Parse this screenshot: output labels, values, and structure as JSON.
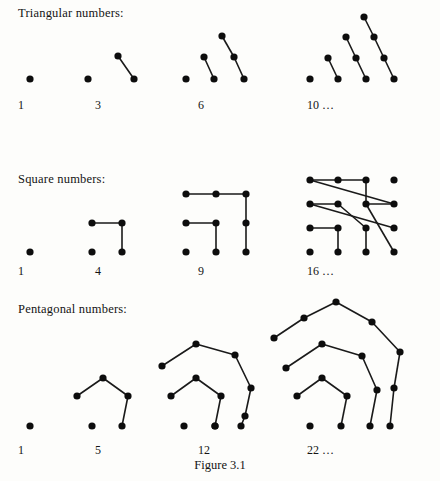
{
  "caption": "Figure 3.1",
  "dot_color": "#0d0d0d",
  "line_color": "#1a1a1a",
  "background": "#fdfdfb",
  "dot_radius": 3.6,
  "sections": [
    {
      "id": "triangular",
      "heading": "Triangular numbers:",
      "heading_x": 18,
      "heading_y": 6,
      "label_y": 98,
      "figures": [
        {
          "id": "triangular-1",
          "label": "1",
          "label_x": 18,
          "origin_x": 16,
          "origin_y": 20,
          "width": 40,
          "height": 75,
          "dots": [
            [
              14,
              59
            ]
          ],
          "edges": []
        },
        {
          "id": "triangular-3",
          "label": "3",
          "label_x": 95,
          "origin_x": 78,
          "origin_y": 20,
          "width": 60,
          "height": 75,
          "dots": [
            [
              10,
              59
            ],
            [
              40,
              36
            ],
            [
              56,
              59
            ]
          ],
          "edges": [
            [
              1,
              2
            ]
          ]
        },
        {
          "id": "triangular-6",
          "label": "6",
          "label_x": 198,
          "origin_x": 174,
          "origin_y": 20,
          "width": 80,
          "height": 75,
          "dots": [
            [
              12,
              59
            ],
            [
              40,
              59
            ],
            [
              30,
              37
            ],
            [
              70,
              59
            ],
            [
              60,
              37
            ],
            [
              48,
              16
            ]
          ],
          "edges": [
            [
              2,
              1
            ],
            [
              5,
              4
            ],
            [
              4,
              3
            ]
          ]
        },
        {
          "id": "triangular-10",
          "label": "10 …",
          "label_x": 307,
          "origin_x": 300,
          "origin_y": 20,
          "width": 105,
          "height": 75,
          "dots": [
            [
              10,
              59
            ],
            [
              38,
              59
            ],
            [
              28,
              38
            ],
            [
              66,
              59
            ],
            [
              56,
              38
            ],
            [
              46,
              17
            ],
            [
              94,
              59
            ],
            [
              84,
              38
            ],
            [
              74,
              17
            ],
            [
              64,
              -3
            ]
          ],
          "edges": [
            [
              2,
              1
            ],
            [
              5,
              4
            ],
            [
              4,
              3
            ],
            [
              9,
              8
            ],
            [
              8,
              7
            ],
            [
              7,
              6
            ]
          ]
        }
      ]
    },
    {
      "id": "square",
      "heading": "Square numbers:",
      "heading_x": 18,
      "heading_y": 172,
      "label_y": 264,
      "figures": [
        {
          "id": "square-1",
          "label": "1",
          "label_x": 18,
          "origin_x": 16,
          "origin_y": 180,
          "width": 40,
          "height": 80,
          "dots": [
            [
              14,
              72
            ]
          ],
          "edges": []
        },
        {
          "id": "square-4",
          "label": "4",
          "label_x": 95,
          "origin_x": 78,
          "origin_y": 180,
          "width": 60,
          "height": 80,
          "dots": [
            [
              14,
              72
            ],
            [
              44,
              72
            ],
            [
              14,
              43
            ],
            [
              44,
              43
            ]
          ],
          "edges": [
            [
              2,
              3
            ],
            [
              3,
              1
            ]
          ]
        },
        {
          "id": "square-9",
          "label": "9",
          "label_x": 198,
          "origin_x": 174,
          "origin_y": 180,
          "width": 80,
          "height": 80,
          "dots": [
            [
              12,
              72
            ],
            [
              42,
              72
            ],
            [
              72,
              72
            ],
            [
              12,
              43
            ],
            [
              42,
              43
            ],
            [
              72,
              43
            ],
            [
              12,
              14
            ],
            [
              42,
              14
            ],
            [
              72,
              14
            ]
          ],
          "edges": [
            [
              3,
              4
            ],
            [
              4,
              1
            ],
            [
              6,
              7
            ],
            [
              7,
              8
            ],
            [
              8,
              5
            ],
            [
              5,
              2
            ]
          ]
        },
        {
          "id": "square-16",
          "label": "16 …",
          "label_x": 307,
          "origin_x": 300,
          "origin_y": 180,
          "width": 100,
          "height": 80,
          "dots": [
            [
              10,
              72
            ],
            [
              38,
              72
            ],
            [
              66,
              72
            ],
            [
              94,
              72
            ],
            [
              10,
              48
            ],
            [
              38,
              48
            ],
            [
              66,
              48
            ],
            [
              94,
              48
            ],
            [
              10,
              24
            ],
            [
              38,
              24
            ],
            [
              66,
              24
            ],
            [
              94,
              24
            ],
            [
              10,
              0
            ],
            [
              38,
              0
            ],
            [
              66,
              0
            ],
            [
              94,
              0
            ]
          ],
          "edges": [
            [
              4,
              5
            ],
            [
              5,
              1
            ],
            [
              7,
              8
            ],
            [
              8,
              9
            ],
            [
              9,
              6
            ],
            [
              6,
              2
            ],
            [
              10,
              11
            ],
            [
              11,
              12
            ],
            [
              12,
              13
            ],
            [
              13,
              14
            ],
            [
              14,
              10
            ],
            [
              10,
              3
            ]
          ]
        }
      ]
    },
    {
      "id": "pentagonal",
      "heading": "Pentagonal numbers:",
      "heading_x": 18,
      "heading_y": 302,
      "label_y": 443,
      "figures": [
        {
          "id": "pentagonal-1",
          "label": "1",
          "label_x": 18,
          "origin_x": 16,
          "origin_y": 310,
          "width": 40,
          "height": 128,
          "dots": [
            [
              14,
              116
            ]
          ],
          "edges": []
        },
        {
          "id": "pentagonal-5",
          "label": "5",
          "label_x": 95,
          "origin_x": 78,
          "origin_y": 310,
          "width": 70,
          "height": 128,
          "dots": [
            [
              14,
              116
            ],
            [
              -1,
              86
            ],
            [
              25,
              68
            ],
            [
              50,
              86
            ],
            [
              44,
              116
            ]
          ],
          "edges": [
            [
              1,
              2
            ],
            [
              2,
              3
            ],
            [
              3,
              4
            ]
          ]
        },
        {
          "id": "pentagonal-12",
          "label": "12",
          "label_x": 198,
          "origin_x": 174,
          "origin_y": 310,
          "width": 110,
          "height": 128,
          "dots": [
            [
              10,
              116
            ],
            [
              -3,
              86
            ],
            [
              22,
              68
            ],
            [
              47,
              86
            ],
            [
              41,
              116
            ],
            [
              -12,
              56
            ],
            [
              22,
              34
            ],
            [
              61,
              45
            ],
            [
              77,
              78
            ],
            [
              71,
              106
            ],
            [
              67,
              116
            ],
            [
              41,
              116
            ]
          ],
          "edges": [
            [
              1,
              2
            ],
            [
              2,
              3
            ],
            [
              3,
              4
            ],
            [
              5,
              6
            ],
            [
              6,
              7
            ],
            [
              7,
              8
            ],
            [
              8,
              9
            ],
            [
              9,
              10
            ]
          ]
        },
        {
          "id": "pentagonal-22",
          "label": "22 …",
          "label_x": 307,
          "origin_x": 300,
          "origin_y": 310,
          "width": 130,
          "height": 128,
          "dots": [
            [
              10,
              116
            ],
            [
              -3,
              86
            ],
            [
              22,
              68
            ],
            [
              47,
              86
            ],
            [
              41,
              116
            ],
            [
              -14,
              58
            ],
            [
              22,
              34
            ],
            [
              62,
              46
            ],
            [
              77,
              80
            ],
            [
              70,
              116
            ],
            [
              -26,
              28
            ],
            [
              4,
              8
            ],
            [
              36,
              -8
            ],
            [
              72,
              12
            ],
            [
              100,
              42
            ],
            [
              94,
              78
            ],
            [
              90,
              116
            ]
          ],
          "edges": [
            [
              1,
              2
            ],
            [
              2,
              3
            ],
            [
              3,
              4
            ],
            [
              5,
              6
            ],
            [
              6,
              7
            ],
            [
              7,
              8
            ],
            [
              8,
              9
            ],
            [
              10,
              11
            ],
            [
              11,
              12
            ],
            [
              12,
              13
            ],
            [
              13,
              14
            ],
            [
              14,
              15
            ],
            [
              15,
              16
            ]
          ]
        }
      ]
    }
  ]
}
